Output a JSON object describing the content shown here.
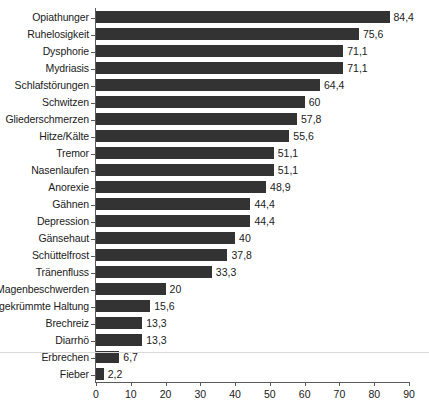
{
  "chart_data": {
    "type": "bar",
    "orientation": "horizontal",
    "title": "",
    "subtitle": "",
    "xlabel": "",
    "ylabel": "",
    "xlim": [
      0,
      90
    ],
    "xticks": [
      "0",
      "10",
      "20",
      "30",
      "40",
      "50",
      "60",
      "70",
      "80",
      "90"
    ],
    "xtick_values": [
      0,
      10,
      20,
      30,
      40,
      50,
      60,
      70,
      80,
      90
    ],
    "grid": false,
    "legend": false,
    "decimal_separator": ",",
    "bar_color": "#333333",
    "background_color": "#ffffff",
    "axis_color": "#5a5a5a",
    "text_color": "#1a1a1a",
    "categories": [
      "Opiathunger",
      "Ruhelosigkeit",
      "Dysphorie",
      "Mydriasis",
      "Schlafstörungen",
      "Schwitzen",
      "Gliederschmerzen",
      "Hitze/Kälte",
      "Tremor",
      "Nasenlaufen",
      "Anorexie",
      "Gähnen",
      "Depression",
      "Gänsehaut",
      "Schüttelfrost",
      "Tränenfluss",
      "Magenbeschwerden",
      "gekrümmte Haltung",
      "Brechreiz",
      "Diarrhö",
      "Erbrechen",
      "Fieber"
    ],
    "values": [
      84.4,
      75.6,
      71.1,
      71.1,
      64.4,
      60,
      57.8,
      55.6,
      51.1,
      51.1,
      48.9,
      44.4,
      44.4,
      40,
      37.8,
      33.3,
      20,
      15.6,
      13.3,
      13.3,
      6.7,
      2.2
    ],
    "value_labels": [
      "84,4",
      "75,6",
      "71,1",
      "71,1",
      "64,4",
      "60",
      "57,8",
      "55,6",
      "51,1",
      "51,1",
      "48,9",
      "44,4",
      "44,4",
      "40",
      "37,8",
      "33,3",
      "20",
      "15,6",
      "13,3",
      "13,3",
      "6,7",
      "2,2"
    ],
    "bars": [
      {
        "label": "Opiathunger",
        "value": 84.4,
        "value_label": "84,4"
      },
      {
        "label": "Ruhelosigkeit",
        "value": 75.6,
        "value_label": "75,6"
      },
      {
        "label": "Dysphorie",
        "value": 71.1,
        "value_label": "71,1"
      },
      {
        "label": "Mydriasis",
        "value": 71.1,
        "value_label": "71,1"
      },
      {
        "label": "Schlafstörungen",
        "value": 64.4,
        "value_label": "64,4"
      },
      {
        "label": "Schwitzen",
        "value": 60,
        "value_label": "60"
      },
      {
        "label": "Gliederschmerzen",
        "value": 57.8,
        "value_label": "57,8"
      },
      {
        "label": "Hitze/Kälte",
        "value": 55.6,
        "value_label": "55,6"
      },
      {
        "label": "Tremor",
        "value": 51.1,
        "value_label": "51,1"
      },
      {
        "label": "Nasenlaufen",
        "value": 51.1,
        "value_label": "51,1"
      },
      {
        "label": "Anorexie",
        "value": 48.9,
        "value_label": "48,9"
      },
      {
        "label": "Gähnen",
        "value": 44.4,
        "value_label": "44,4"
      },
      {
        "label": "Depression",
        "value": 44.4,
        "value_label": "44,4"
      },
      {
        "label": "Gänsehaut",
        "value": 40,
        "value_label": "40"
      },
      {
        "label": "Schüttelfrost",
        "value": 37.8,
        "value_label": "37,8"
      },
      {
        "label": "Tränenfluss",
        "value": 33.3,
        "value_label": "33,3"
      },
      {
        "label": "Magenbeschwerden",
        "value": 20,
        "value_label": "20"
      },
      {
        "label": "gekrümmte Haltung",
        "value": 15.6,
        "value_label": "15,6"
      },
      {
        "label": "Brechreiz",
        "value": 13.3,
        "value_label": "13,3"
      },
      {
        "label": "Diarrhö",
        "value": 13.3,
        "value_label": "13,3"
      },
      {
        "label": "Erbrechen",
        "value": 6.7,
        "value_label": "6,7"
      },
      {
        "label": "Fieber",
        "value": 2.2,
        "value_label": "2,2"
      }
    ]
  }
}
